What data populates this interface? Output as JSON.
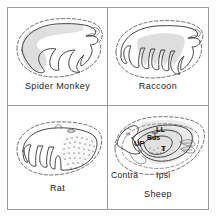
{
  "figure": {
    "type": "comparative-anatomy-panel-figure",
    "panel_count": 4,
    "layout": "2x2 grid",
    "frame_color": "#9a9a9a",
    "shading_color": "#d8d8d8",
    "outline_color": "#3a3a3a"
  },
  "panels": [
    {
      "id": "spider-monkey",
      "caption": "Spider  Monkey",
      "position": "top-left",
      "features": {
        "outer_boundary": "dashed",
        "inner_boundary": "solid folded lamina",
        "shading": "grey band along left and upper lamina",
        "stipple": false
      }
    },
    {
      "id": "raccoon",
      "caption": "Raccoon",
      "position": "top-right",
      "features": {
        "outer_boundary": "dashed",
        "inner_boundary": "solid deeply folded lamina with finger-like projections",
        "shading": "grey central region",
        "stipple": false
      }
    },
    {
      "id": "rat",
      "caption": "Rat",
      "position": "bottom-left",
      "features": {
        "outer_boundary": "dashed",
        "inner_boundary": "solid lamina with left-side folds",
        "shading": "none",
        "stipple": true
      }
    },
    {
      "id": "sheep",
      "caption": "Sheep",
      "position": "bottom-right",
      "features": {
        "outer_boundary": "dashed",
        "inner_boundary": "solid concentric laminae",
        "shading": "grey central region",
        "stipple": true
      },
      "orientation_labels": {
        "left": "Contra",
        "right": "Ipsi"
      },
      "nucleus_labels": [
        {
          "id": "ll",
          "text": "LL"
        },
        {
          "id": "up",
          "text": "UP"
        },
        {
          "id": "bus",
          "text": "Bus"
        },
        {
          "id": "t",
          "text": "T"
        }
      ]
    }
  ]
}
